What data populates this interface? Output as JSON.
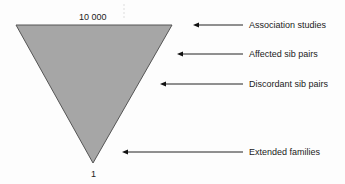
{
  "diagram": {
    "type": "inverted-triangle",
    "top_label": "10 000",
    "bottom_label": "1",
    "fill_color": "#a6a6a6",
    "stroke_color": "#444444",
    "annotations": [
      {
        "label": "Association studies"
      },
      {
        "label": "Affected sib pairs"
      },
      {
        "label": "Discordant sib pairs"
      },
      {
        "label": "Extended families"
      }
    ]
  }
}
